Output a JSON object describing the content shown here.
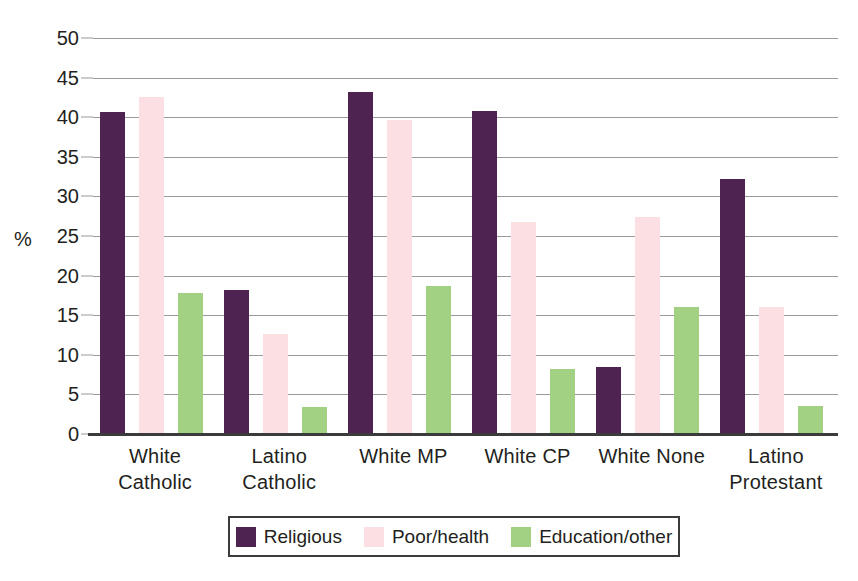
{
  "chart_data": {
    "type": "bar",
    "title": "",
    "xlabel": "",
    "ylabel": "%",
    "ylim": [
      0,
      50
    ],
    "ytick_step": 5,
    "grid": true,
    "legend_position": "bottom",
    "categories": [
      "White Catholic",
      "Latino Catholic",
      "White MP",
      "White CP",
      "White None",
      "Latino Protestant"
    ],
    "category_lines": [
      [
        "White",
        "Catholic"
      ],
      [
        "Latino",
        "Catholic"
      ],
      [
        "White MP"
      ],
      [
        "White CP"
      ],
      [
        "White None"
      ],
      [
        "Latino",
        "Protestant"
      ]
    ],
    "ytick_labels": [
      "0",
      "5",
      "10",
      "15",
      "20",
      "25",
      "30",
      "35",
      "40",
      "45",
      "50"
    ],
    "ytick_values": [
      0,
      5,
      10,
      15,
      20,
      25,
      30,
      35,
      40,
      45,
      50
    ],
    "series": [
      {
        "name": "Religious",
        "color": "#4e2351",
        "values": [
          40.6,
          18.2,
          43.2,
          40.8,
          8.5,
          32.2
        ]
      },
      {
        "name": "Poor/health",
        "color": "#fbdfe2",
        "values": [
          42.6,
          12.6,
          39.6,
          26.8,
          27.4,
          16.1
        ]
      },
      {
        "name": "Education/other",
        "color": "#a3d183",
        "values": [
          17.8,
          3.4,
          18.7,
          8.2,
          16.1,
          3.5
        ]
      }
    ]
  },
  "legend": {
    "items": [
      {
        "label": "Religious",
        "swatch": "religious"
      },
      {
        "label": "Poor/health",
        "swatch": "poorhealth"
      },
      {
        "label": "Education/other",
        "swatch": "education"
      }
    ]
  },
  "axis": {
    "y_label": "%"
  }
}
